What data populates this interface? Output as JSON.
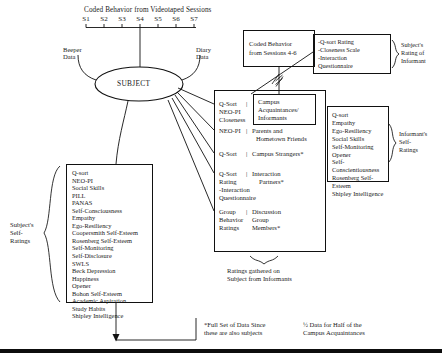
{
  "diagram": {
    "top_title": "Coded Behavior from Videotaped Sessions",
    "session_labels": [
      "S1",
      "S2",
      "S3",
      "S4",
      "S5",
      "S6",
      "S7"
    ],
    "beeper_label_l1": "Beeper",
    "beeper_label_l2": "Data",
    "diary_label_l1": "Diary",
    "diary_label_l2": "Data",
    "subject_node": "SUBJECT",
    "coded_sessions_box": {
      "line1": "Coded Behavior",
      "line2": "from Sessions 4-6"
    },
    "subject_rating_box": {
      "line1": "-Q-sort Rating",
      "line2": "-Closeness Scale",
      "line3": "-Interaction",
      "line4": "Questionnaire"
    },
    "subject_rating_brace_label": {
      "line1": "Subject's",
      "line2": "Rating of",
      "line3": "Informant"
    },
    "informant_rows": [
      {
        "measure_lines": [
          "Q-Sort",
          "NEO-PI",
          "Closeness"
        ],
        "target_lines": [
          "Campus",
          "Acquaintances/",
          "Informants"
        ],
        "boxed": true
      },
      {
        "measure_lines": [
          "NEO-PI"
        ],
        "target_lines": [
          "Parents and",
          "Hometown Friends"
        ],
        "boxed": false
      },
      {
        "measure_lines": [
          "Q-Sort"
        ],
        "target_lines": [
          "Campus Strangers*"
        ],
        "boxed": false
      },
      {
        "measure_lines": [
          "Q-Sort",
          "Rating",
          "-Interaction",
          "Questionnaire"
        ],
        "target_lines": [
          "Interaction",
          "Partners*"
        ],
        "boxed": false
      },
      {
        "measure_lines": [
          "Group",
          "Behavior",
          "Ratings"
        ],
        "target_lines": [
          "Discussion",
          "Group",
          "Members*"
        ],
        "boxed": false
      }
    ],
    "informants_caption": {
      "line1": "Ratings gathered on",
      "line2": "Subject from Informants"
    },
    "subject_self_ratings_label": {
      "line1": "Subject's",
      "line2": "Self-",
      "line3": "Ratings"
    },
    "subject_self_ratings_list": [
      "Q-sort",
      "NEO-PI",
      "Social Skills",
      "PILL",
      "PANAS",
      "Self-Consciousness",
      "Empathy",
      "Ego-Resiliency",
      "Coopersmith Self-Esteem",
      "Rosenberg Self-Esteem",
      "Self-Monitoring",
      "Self-Disclosure",
      "SWLS",
      "Beck Depression",
      "Happiness",
      "Opener",
      "Bohon Self-Esteem",
      "Academic Aspiration",
      "Study Habits",
      "Shipley Intelligence"
    ],
    "informant_self_ratings_label": {
      "line1": "Informant's",
      "line2": "Self-",
      "line3": "Ratings"
    },
    "informant_self_ratings_list": [
      "Q-sort",
      "Empathy",
      "Ego-Resiliency",
      "Social Skills",
      "Self-Monitoring",
      "Opener",
      "Self-Conscientiousness",
      "Rosenberg Self-Esteem",
      "Shipley Intelligence"
    ],
    "footnote_left": {
      "line1": "*Full Set of Data Since",
      "line2": "these are also subjects"
    },
    "footnote_right": {
      "line1": "½ Data for Half of the",
      "line2": "Campus Acquaintances"
    }
  }
}
